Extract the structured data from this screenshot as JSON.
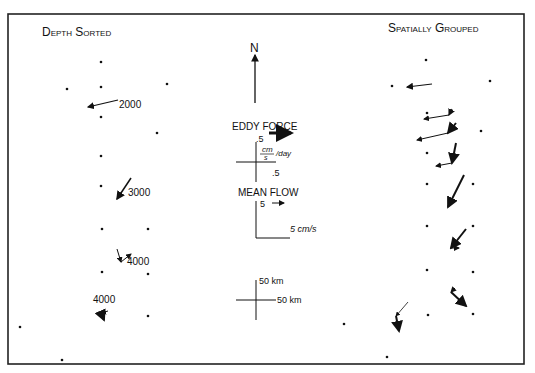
{
  "panels": {
    "left_title": "Depth Sorted",
    "right_title": "Spatially Grouped"
  },
  "north": {
    "label": "N",
    "x": 255,
    "y1": 103,
    "y2": 55
  },
  "legend": {
    "eddy_force": {
      "title": "EDDY FORCE",
      "scale_y": ".5",
      "scale_x": ".5",
      "units_num": "cm",
      "units_den": "s",
      "units_suffix": "/day"
    },
    "mean_flow": {
      "title": "MEAN FLOW",
      "scale_y": "5",
      "scale_x": "5 cm/s"
    },
    "distance": {
      "scale_y": "50 km",
      "scale_x": "50 km"
    }
  },
  "depth_labels": [
    {
      "text": "2000",
      "x": 119,
      "y": 108
    },
    {
      "text": "3000",
      "x": 128,
      "y": 196
    },
    {
      "text": "4000",
      "x": 127,
      "y": 265
    },
    {
      "text": "4000",
      "x": 93,
      "y": 303
    }
  ],
  "dots": [
    [
      101,
      62
    ],
    [
      101,
      87
    ],
    [
      67,
      89
    ],
    [
      167,
      84
    ],
    [
      101,
      117
    ],
    [
      157,
      133
    ],
    [
      101,
      156
    ],
    [
      101,
      186
    ],
    [
      102,
      229
    ],
    [
      148,
      229
    ],
    [
      102,
      272
    ],
    [
      148,
      274
    ],
    [
      148,
      316
    ],
    [
      20,
      327
    ],
    [
      62,
      360
    ],
    [
      426,
      60
    ],
    [
      392,
      86
    ],
    [
      490,
      81
    ],
    [
      427,
      113
    ],
    [
      481,
      131
    ],
    [
      427,
      153
    ],
    [
      427,
      184
    ],
    [
      473,
      184
    ],
    [
      427,
      226
    ],
    [
      473,
      226
    ],
    [
      427,
      270
    ],
    [
      473,
      272
    ],
    [
      428,
      315
    ],
    [
      473,
      314
    ],
    [
      344,
      324
    ],
    [
      387,
      357
    ]
  ],
  "vectors": [
    {
      "x1": 118,
      "y1": 100,
      "x2": 88,
      "y2": 107,
      "w": 1.2
    },
    {
      "x1": 131,
      "y1": 178,
      "x2": 117,
      "y2": 199,
      "w": 1.5
    },
    {
      "x1": 117,
      "y1": 249,
      "x2": 121,
      "y2": 262,
      "w": 1
    },
    {
      "x1": 121,
      "y1": 262,
      "x2": 131,
      "y2": 254,
      "w": 1
    },
    {
      "x1": 108,
      "y1": 311,
      "x2": 101,
      "y2": 313,
      "w": 1
    },
    {
      "x1": 101,
      "y1": 313,
      "x2": 104,
      "y2": 320,
      "w": 2
    },
    {
      "x1": 432,
      "y1": 84,
      "x2": 407,
      "y2": 87,
      "w": 1.2
    },
    {
      "x1": 452,
      "y1": 109,
      "x2": 449,
      "y2": 115,
      "w": 1.2
    },
    {
      "x1": 449,
      "y1": 115,
      "x2": 424,
      "y2": 119,
      "w": 1
    },
    {
      "x1": 456,
      "y1": 123,
      "x2": 448,
      "y2": 133,
      "w": 2
    },
    {
      "x1": 448,
      "y1": 133,
      "x2": 417,
      "y2": 140,
      "w": 1
    },
    {
      "x1": 456,
      "y1": 143,
      "x2": 452,
      "y2": 163,
      "w": 2
    },
    {
      "x1": 452,
      "y1": 163,
      "x2": 436,
      "y2": 166,
      "w": 1
    },
    {
      "x1": 464,
      "y1": 175,
      "x2": 448,
      "y2": 207,
      "w": 2
    },
    {
      "x1": 466,
      "y1": 229,
      "x2": 451,
      "y2": 248,
      "w": 2
    },
    {
      "x1": 451,
      "y1": 248,
      "x2": 459,
      "y2": 248,
      "w": 1
    },
    {
      "x1": 455,
      "y1": 288,
      "x2": 451,
      "y2": 292,
      "w": 1
    },
    {
      "x1": 451,
      "y1": 292,
      "x2": 466,
      "y2": 306,
      "w": 2
    },
    {
      "x1": 408,
      "y1": 302,
      "x2": 396,
      "y2": 316,
      "w": 0.8
    },
    {
      "x1": 396,
      "y1": 316,
      "x2": 399,
      "y2": 331,
      "w": 2
    }
  ]
}
